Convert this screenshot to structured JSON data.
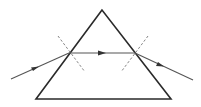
{
  "diagram": {
    "type": "prism-refraction",
    "colors": {
      "prism": "#2a2a2a",
      "ray": "#555555",
      "normal": "#777777",
      "background": "#ffffff"
    },
    "prism": {
      "apex": [
        102,
        10
      ],
      "base_left": [
        36,
        99
      ],
      "base_right": [
        171,
        99
      ]
    },
    "incident_ray": {
      "from": [
        11,
        79
      ],
      "to": [
        69,
        53
      ]
    },
    "internal_ray": {
      "from": [
        69,
        53
      ],
      "to": [
        135,
        53
      ]
    },
    "emergent_ray": {
      "from": [
        135,
        53
      ],
      "to": [
        193,
        80
      ]
    },
    "normals": [
      {
        "from": [
          58,
          36
        ],
        "to": [
          85,
          72
        ]
      },
      {
        "from": [
          148,
          36
        ],
        "to": [
          121,
          72
        ]
      }
    ]
  }
}
